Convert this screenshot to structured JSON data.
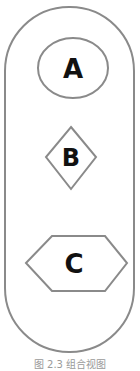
{
  "diagram": {
    "container": {
      "shape": "stadium",
      "stroke": "#8a8a8a"
    },
    "nodes": [
      {
        "id": "A",
        "label": "A",
        "shape": "ellipse"
      },
      {
        "id": "B",
        "label": "B",
        "shape": "diamond"
      },
      {
        "id": "C",
        "label": "C",
        "shape": "hexagon"
      }
    ],
    "stroke_color": "#8a8a8a",
    "text_color": "#111111"
  },
  "caption": "图 2.3  组合视图"
}
